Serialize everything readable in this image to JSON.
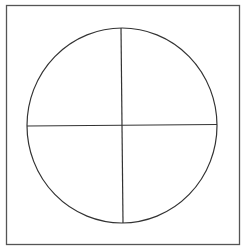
{
  "diagram": {
    "type": "circle-quadrants",
    "frame": {
      "x": 6,
      "y": 5,
      "width": 234,
      "height": 240,
      "stroke": "#555555"
    },
    "circle": {
      "cx": 122,
      "cy": 125.5,
      "rx": 95,
      "ry": 97.5,
      "stroke": "#333333"
    },
    "lines": {
      "vertical": {
        "x1": 121,
        "y1": 28,
        "x2": 123,
        "y2": 223
      },
      "horizontal": {
        "x1": 27,
        "y1": 126,
        "x2": 217,
        "y2": 124.5
      }
    },
    "quadrants": [
      "top-left",
      "top-right",
      "bottom-left",
      "bottom-right"
    ]
  }
}
